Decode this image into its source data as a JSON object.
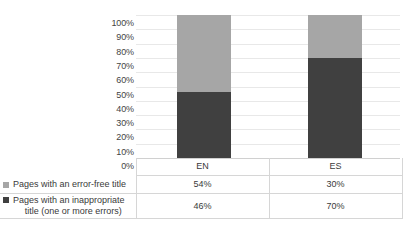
{
  "chart_data": {
    "type": "bar",
    "subtype": "100%-stacked-column",
    "title": "",
    "xlabel": "",
    "ylabel": "",
    "ylim": [
      0,
      100
    ],
    "grid": true,
    "legend_position": "left-table",
    "categories": [
      "EN",
      "ES"
    ],
    "y_ticks": [
      "0%",
      "10%",
      "20%",
      "30%",
      "40%",
      "50%",
      "60%",
      "70%",
      "80%",
      "90%",
      "100%"
    ],
    "series": [
      {
        "name": "Pages with an error-free title",
        "color": "#a6a6a6",
        "values": [
          54,
          30
        ],
        "labels": [
          "54%",
          "30%"
        ],
        "stack_position": "top"
      },
      {
        "name": "Pages with an inappropriate title (one or more errors)",
        "name_line1": "Pages with an inappropriate",
        "name_line2": "title (one or more errors)",
        "color": "#404040",
        "values": [
          46,
          70
        ],
        "labels": [
          "46%",
          "70%"
        ],
        "stack_position": "bottom"
      }
    ]
  },
  "table": {
    "category_row": [
      "EN",
      "ES"
    ],
    "rows": [
      {
        "legend": "Pages with an error-free title",
        "values": [
          "54%",
          "30%"
        ]
      },
      {
        "legend_line1": "Pages with an inappropriate",
        "legend_line2": "title (one or more errors)",
        "values": [
          "46%",
          "70%"
        ]
      }
    ]
  }
}
